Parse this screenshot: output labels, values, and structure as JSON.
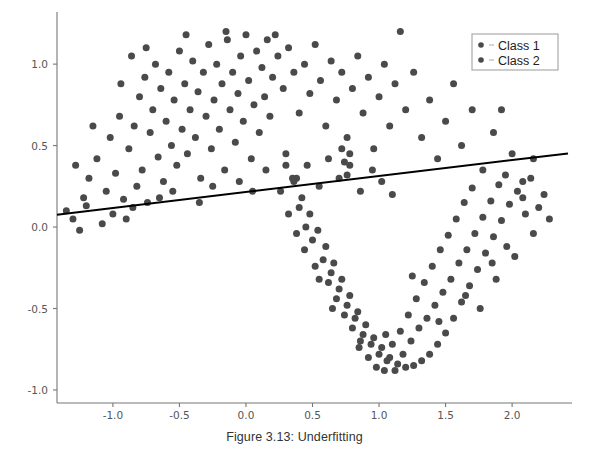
{
  "caption": "Figure 3.13: Underfitting",
  "legend": {
    "position": "upper-right",
    "entries": [
      {
        "label": "Class 1",
        "marker": "circle-marker",
        "color": "#4a4a4a"
      },
      {
        "label": "Class 2",
        "marker": "circle-marker",
        "color": "#4a4a4a"
      }
    ]
  },
  "chart_data": {
    "type": "scatter",
    "title": "",
    "xlabel": "",
    "ylabel": "",
    "xlim": [
      -1.42,
      2.45
    ],
    "ylim": [
      -1.08,
      1.32
    ],
    "xticks": [
      -1.0,
      -0.5,
      0.0,
      0.5,
      1.0,
      1.5,
      2.0
    ],
    "xticklabels": [
      "-1.0",
      "-0.5",
      "0.0",
      "0.5",
      "1.0",
      "1.5",
      "2.0"
    ],
    "yticks": [
      -1.0,
      -0.5,
      0.0,
      0.5,
      1.0
    ],
    "yticklabels": [
      "-1.0",
      "-0.5",
      "0.0",
      "0.5",
      "1.0"
    ],
    "grid": false,
    "marker_color": "#4a4a4a",
    "marker_size": 7,
    "series": [
      {
        "name": "Class 1",
        "color": "#4a4a4a",
        "points": [
          [
            -1.3,
            0.05
          ],
          [
            -1.25,
            -0.02
          ],
          [
            -1.22,
            0.18
          ],
          [
            -1.18,
            0.3
          ],
          [
            -1.12,
            0.42
          ],
          [
            -1.2,
            0.13
          ],
          [
            -1.08,
            0.02
          ],
          [
            -1.05,
            0.22
          ],
          [
            -1.02,
            0.55
          ],
          [
            -0.98,
            0.33
          ],
          [
            -0.95,
            0.68
          ],
          [
            -0.92,
            0.17
          ],
          [
            -0.9,
            0.05
          ],
          [
            -0.88,
            0.48
          ],
          [
            -0.86,
            1.05
          ],
          [
            -0.84,
            0.62
          ],
          [
            -0.82,
            0.25
          ],
          [
            -0.8,
            0.8
          ],
          [
            -0.78,
            0.35
          ],
          [
            -0.76,
            0.92
          ],
          [
            -0.74,
            0.15
          ],
          [
            -0.72,
            0.58
          ],
          [
            -0.7,
            0.72
          ],
          [
            -0.68,
            1.0
          ],
          [
            -0.66,
            0.43
          ],
          [
            -0.64,
            0.85
          ],
          [
            -0.62,
            0.28
          ],
          [
            -0.6,
            0.65
          ],
          [
            -0.58,
            0.95
          ],
          [
            -0.56,
            0.5
          ],
          [
            -0.54,
            0.78
          ],
          [
            -0.52,
            0.38
          ],
          [
            -0.5,
            1.08
          ],
          [
            -0.48,
            0.6
          ],
          [
            -0.46,
            0.88
          ],
          [
            -0.44,
            0.45
          ],
          [
            -0.42,
            0.72
          ],
          [
            -0.4,
            1.02
          ],
          [
            -0.38,
            0.55
          ],
          [
            -0.36,
            0.83
          ],
          [
            -0.34,
            0.3
          ],
          [
            -0.32,
            0.95
          ],
          [
            -0.3,
            0.68
          ],
          [
            -0.28,
            1.12
          ],
          [
            -0.26,
            0.48
          ],
          [
            -0.24,
            0.78
          ],
          [
            -0.22,
            1.0
          ],
          [
            -0.2,
            0.6
          ],
          [
            -0.18,
            0.88
          ],
          [
            -0.16,
            0.35
          ],
          [
            -0.14,
            1.15
          ],
          [
            -0.12,
            0.72
          ],
          [
            -0.1,
            0.95
          ],
          [
            -0.08,
            0.52
          ],
          [
            -0.06,
            0.82
          ],
          [
            -0.04,
            1.05
          ],
          [
            -0.02,
            0.65
          ],
          [
            0.0,
            1.18
          ],
          [
            0.02,
            0.9
          ],
          [
            0.04,
            0.42
          ],
          [
            0.06,
            0.75
          ],
          [
            0.08,
            1.08
          ],
          [
            0.1,
            0.58
          ],
          [
            0.12,
            0.98
          ],
          [
            0.14,
            0.8
          ],
          [
            0.16,
            1.15
          ],
          [
            0.18,
            0.68
          ],
          [
            0.2,
            0.92
          ],
          [
            0.24,
            1.05
          ],
          [
            0.28,
            0.85
          ],
          [
            0.32,
            1.1
          ],
          [
            0.36,
            0.95
          ],
          [
            0.4,
            0.7
          ],
          [
            0.44,
            1.0
          ],
          [
            0.48,
            0.82
          ],
          [
            0.52,
            1.12
          ],
          [
            0.56,
            0.9
          ],
          [
            0.6,
            0.62
          ],
          [
            0.64,
            1.02
          ],
          [
            0.68,
            0.78
          ],
          [
            0.72,
            0.95
          ],
          [
            0.76,
            0.55
          ],
          [
            0.8,
            0.85
          ],
          [
            0.84,
            1.05
          ],
          [
            0.88,
            0.7
          ],
          [
            0.92,
            0.92
          ],
          [
            0.96,
            0.48
          ],
          [
            1.0,
            0.8
          ],
          [
            1.04,
            1.0
          ],
          [
            1.08,
            0.62
          ],
          [
            1.12,
            0.88
          ],
          [
            1.16,
            1.2
          ],
          [
            1.2,
            0.72
          ],
          [
            1.26,
            0.95
          ],
          [
            1.32,
            0.55
          ],
          [
            1.38,
            0.78
          ],
          [
            1.44,
            0.42
          ],
          [
            1.5,
            0.65
          ],
          [
            1.56,
            0.88
          ],
          [
            1.62,
            0.5
          ],
          [
            1.7,
            0.72
          ],
          [
            1.78,
            0.35
          ],
          [
            1.86,
            0.58
          ],
          [
            1.92,
            0.72
          ],
          [
            2.0,
            0.45
          ],
          [
            2.08,
            0.28
          ],
          [
            2.16,
            0.42
          ],
          [
            2.24,
            0.2
          ],
          [
            -1.35,
            0.1
          ],
          [
            -1.28,
            0.38
          ],
          [
            -1.15,
            0.62
          ],
          [
            -1.0,
            0.08
          ],
          [
            -0.94,
            0.88
          ],
          [
            -0.85,
            0.12
          ],
          [
            -0.75,
            1.1
          ],
          [
            -0.65,
            0.18
          ],
          [
            -0.55,
            0.22
          ],
          [
            -0.45,
            1.18
          ],
          [
            -0.35,
            0.15
          ],
          [
            -0.25,
            0.25
          ],
          [
            -0.15,
            1.2
          ],
          [
            -0.05,
            0.28
          ],
          [
            0.05,
            0.22
          ],
          [
            0.15,
            0.35
          ],
          [
            0.22,
            1.18
          ],
          [
            0.3,
            0.45
          ],
          [
            0.38,
            0.3
          ],
          [
            0.46,
            0.38
          ],
          [
            0.55,
            0.25
          ],
          [
            0.62,
            0.42
          ],
          [
            0.7,
            0.3
          ],
          [
            0.78,
            0.38
          ],
          [
            0.86,
            0.22
          ],
          [
            0.95,
            0.35
          ],
          [
            1.02,
            0.28
          ],
          [
            1.1,
            0.2
          ],
          [
            0.72,
            0.48
          ],
          [
            0.74,
            0.4
          ],
          [
            0.76,
            0.32
          ],
          [
            0.78,
            0.45
          ]
        ]
      },
      {
        "name": "Class 2",
        "color": "#4a4a4a",
        "points": [
          [
            0.3,
            0.38
          ],
          [
            0.36,
            0.28
          ],
          [
            0.42,
            0.18
          ],
          [
            0.48,
            0.08
          ],
          [
            0.54,
            -0.02
          ],
          [
            0.6,
            -0.12
          ],
          [
            0.66,
            -0.22
          ],
          [
            0.72,
            -0.32
          ],
          [
            0.78,
            -0.42
          ],
          [
            0.84,
            -0.52
          ],
          [
            0.9,
            -0.6
          ],
          [
            0.96,
            -0.68
          ],
          [
            1.02,
            -0.74
          ],
          [
            1.08,
            -0.8
          ],
          [
            1.14,
            -0.84
          ],
          [
            1.2,
            -0.86
          ],
          [
            1.26,
            -0.85
          ],
          [
            1.32,
            -0.82
          ],
          [
            1.38,
            -0.78
          ],
          [
            1.44,
            -0.72
          ],
          [
            1.5,
            -0.65
          ],
          [
            1.56,
            -0.56
          ],
          [
            1.62,
            -0.46
          ],
          [
            1.68,
            -0.36
          ],
          [
            1.74,
            -0.26
          ],
          [
            1.8,
            -0.16
          ],
          [
            1.86,
            -0.06
          ],
          [
            1.92,
            0.04
          ],
          [
            1.98,
            0.14
          ],
          [
            2.04,
            0.22
          ],
          [
            2.1,
            0.08
          ],
          [
            2.16,
            -0.04
          ],
          [
            0.35,
            0.3
          ],
          [
            0.4,
            0.12
          ],
          [
            0.45,
            0.0
          ],
          [
            0.5,
            -0.08
          ],
          [
            0.58,
            -0.2
          ],
          [
            0.64,
            -0.28
          ],
          [
            0.7,
            -0.38
          ],
          [
            0.76,
            -0.48
          ],
          [
            0.82,
            -0.56
          ],
          [
            0.88,
            -0.66
          ],
          [
            0.94,
            -0.72
          ],
          [
            1.0,
            -0.78
          ],
          [
            1.06,
            -0.82
          ],
          [
            1.12,
            -0.88
          ],
          [
            1.18,
            -0.78
          ],
          [
            1.24,
            -0.7
          ],
          [
            1.3,
            -0.62
          ],
          [
            1.36,
            -0.56
          ],
          [
            1.42,
            -0.48
          ],
          [
            1.48,
            -0.4
          ],
          [
            1.54,
            -0.32
          ],
          [
            1.6,
            -0.22
          ],
          [
            1.66,
            -0.14
          ],
          [
            1.72,
            -0.04
          ],
          [
            1.78,
            0.06
          ],
          [
            1.84,
            0.16
          ],
          [
            1.9,
            0.26
          ],
          [
            1.96,
            -0.12
          ],
          [
            0.26,
            0.22
          ],
          [
            0.32,
            0.08
          ],
          [
            0.38,
            -0.04
          ],
          [
            0.44,
            -0.14
          ],
          [
            0.52,
            -0.24
          ],
          [
            0.62,
            -0.34
          ],
          [
            0.68,
            -0.44
          ],
          [
            0.74,
            -0.54
          ],
          [
            0.8,
            -0.62
          ],
          [
            0.86,
            -0.7
          ],
          [
            0.92,
            -0.8
          ],
          [
            0.98,
            -0.86
          ],
          [
            1.04,
            -0.88
          ],
          [
            1.1,
            -0.72
          ],
          [
            1.16,
            -0.64
          ],
          [
            1.22,
            -0.54
          ],
          [
            1.28,
            -0.44
          ],
          [
            1.34,
            -0.34
          ],
          [
            1.4,
            -0.24
          ],
          [
            1.46,
            -0.14
          ],
          [
            1.52,
            -0.05
          ],
          [
            1.58,
            0.05
          ],
          [
            1.64,
            0.15
          ],
          [
            1.7,
            0.24
          ],
          [
            2.08,
            0.18
          ],
          [
            2.14,
            0.3
          ],
          [
            2.2,
            0.12
          ],
          [
            2.28,
            0.05
          ],
          [
            0.55,
            -0.32
          ],
          [
            0.65,
            -0.5
          ],
          [
            0.85,
            -0.74
          ],
          [
            1.05,
            -0.66
          ],
          [
            1.25,
            -0.3
          ],
          [
            1.45,
            -0.58
          ],
          [
            1.65,
            -0.42
          ],
          [
            1.85,
            -0.22
          ],
          [
            1.95,
            0.32
          ],
          [
            2.02,
            -0.18
          ],
          [
            1.88,
            -0.32
          ],
          [
            1.76,
            -0.5
          ]
        ]
      }
    ],
    "line": {
      "name": "decision-boundary",
      "color": "#000000",
      "width": 2,
      "x": [
        -1.42,
        2.42
      ],
      "y": [
        0.076,
        0.452
      ]
    }
  }
}
